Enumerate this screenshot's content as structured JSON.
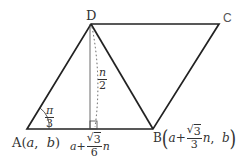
{
  "figure": {
    "type": "rhombus-coordinate-diagram",
    "colors": {
      "stroke": "#222222",
      "aux_stroke": "#555555",
      "text": "#333333",
      "background": "#ffffff"
    },
    "vertices": {
      "A": {
        "label": "A",
        "coords": "(a, b)",
        "x": 27,
        "y": 129
      },
      "B": {
        "label": "B",
        "x": 153,
        "y": 129
      },
      "C": {
        "label": "C",
        "x": 219,
        "y": 24
      },
      "D": {
        "label": "D",
        "x": 91,
        "y": 24
      }
    },
    "labels": {
      "A": "A",
      "A_open": "(",
      "A_a": "a",
      "A_comma": ",",
      "A_b": "b",
      "A_close": ")",
      "B": "B",
      "B_a": "a",
      "B_plus": "+",
      "B_frac_num": "3",
      "B_frac_den": "3",
      "B_n": "n",
      "B_comma": ",",
      "B_b": "b",
      "C": "C",
      "D": "D",
      "angle_num": "π",
      "angle_den": "3",
      "height_num": "n",
      "height_den": "2",
      "foot_a": "a",
      "foot_plus": "+",
      "foot_frac_num": "3",
      "foot_frac_den": "6",
      "foot_n": "n"
    },
    "angle_A": "π/3",
    "height": "n/2",
    "foot_x": "a + (√3/6)n",
    "B_coords": "(a + (√3/3)n, b)"
  }
}
